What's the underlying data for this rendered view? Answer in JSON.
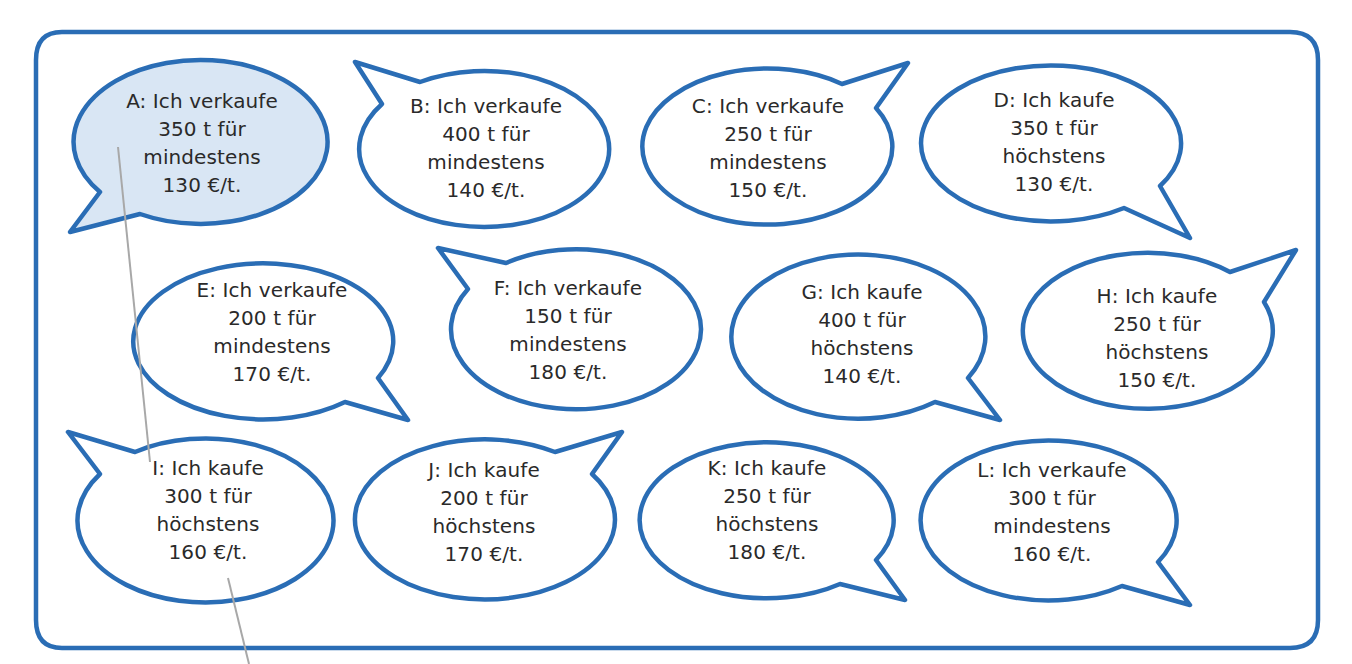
{
  "colors": {
    "stroke": "#2a6db5",
    "fill_highlight": "#d9e6f4",
    "fill_default": "#ffffff",
    "frame_stroke": "#2a6db5",
    "frame_side_accent": "#e08a2c",
    "pointer_line": "#a8a8a8",
    "text": "#2a2a2a"
  },
  "bubbles": [
    {
      "id": "A",
      "label": "A: Ich verkaufe",
      "amount": "350 t für",
      "qualifier": "mindestens",
      "price": "130 €/t.",
      "action": "verkaufe",
      "tons": 350,
      "limit_price": 130,
      "highlighted": true
    },
    {
      "id": "B",
      "label": "B: Ich verkaufe",
      "amount": "400 t für",
      "qualifier": "mindestens",
      "price": "140 €/t.",
      "action": "verkaufe",
      "tons": 400,
      "limit_price": 140,
      "highlighted": false
    },
    {
      "id": "C",
      "label": "C: Ich verkaufe",
      "amount": "250 t für",
      "qualifier": "mindestens",
      "price": "150 €/t.",
      "action": "verkaufe",
      "tons": 250,
      "limit_price": 150,
      "highlighted": false
    },
    {
      "id": "D",
      "label": "D: Ich kaufe",
      "amount": "350 t für",
      "qualifier": "höchstens",
      "price": "130 €/t.",
      "action": "kaufe",
      "tons": 350,
      "limit_price": 130,
      "highlighted": false
    },
    {
      "id": "E",
      "label": "E: Ich verkaufe",
      "amount": "200 t für",
      "qualifier": "mindestens",
      "price": "170 €/t.",
      "action": "verkaufe",
      "tons": 200,
      "limit_price": 170,
      "highlighted": false
    },
    {
      "id": "F",
      "label": "F: Ich verkaufe",
      "amount": "150 t für",
      "qualifier": "mindestens",
      "price": "180 €/t.",
      "action": "verkaufe",
      "tons": 150,
      "limit_price": 180,
      "highlighted": false
    },
    {
      "id": "G",
      "label": "G: Ich kaufe",
      "amount": "400 t für",
      "qualifier": "höchstens",
      "price": "140 €/t.",
      "action": "kaufe",
      "tons": 400,
      "limit_price": 140,
      "highlighted": false
    },
    {
      "id": "H",
      "label": "H: Ich kaufe",
      "amount": "250 t für",
      "qualifier": "höchstens",
      "price": "150 €/t.",
      "action": "kaufe",
      "tons": 250,
      "limit_price": 150,
      "highlighted": false
    },
    {
      "id": "I",
      "label": "I: Ich kaufe",
      "amount": "300 t für",
      "qualifier": "höchstens",
      "price": "160 €/t.",
      "action": "kaufe",
      "tons": 300,
      "limit_price": 160,
      "highlighted": false
    },
    {
      "id": "J",
      "label": "J: Ich kaufe",
      "amount": "200 t für",
      "qualifier": "höchstens",
      "price": "170 €/t.",
      "action": "kaufe",
      "tons": 200,
      "limit_price": 170,
      "highlighted": false
    },
    {
      "id": "K",
      "label": "K: Ich kaufe",
      "amount": "250 t für",
      "qualifier": "höchstens",
      "price": "180 €/t.",
      "action": "kaufe",
      "tons": 250,
      "limit_price": 180,
      "highlighted": false
    },
    {
      "id": "L",
      "label": "L: Ich verkaufe",
      "amount": "300 t für",
      "qualifier": "mindestens",
      "price": "160 €/t.",
      "action": "verkaufe",
      "tons": 300,
      "limit_price": 160,
      "highlighted": false
    }
  ]
}
